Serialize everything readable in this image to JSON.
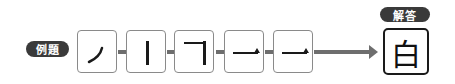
{
  "example_label": "例題",
  "answer_label": "解答",
  "strokes": [
    {
      "name": "stroke-left-falling",
      "shape": "ノ"
    },
    {
      "name": "stroke-vertical",
      "shape": "丨"
    },
    {
      "name": "stroke-horizontal-turn",
      "shape": "𠃌"
    },
    {
      "name": "stroke-horizontal",
      "shape": "一"
    },
    {
      "name": "stroke-horizontal",
      "shape": "一"
    }
  ],
  "answer": "白",
  "colors": {
    "badge": "#3a3a3a",
    "connector": "#6e6e6e",
    "box_border": "#8a8a8a"
  }
}
